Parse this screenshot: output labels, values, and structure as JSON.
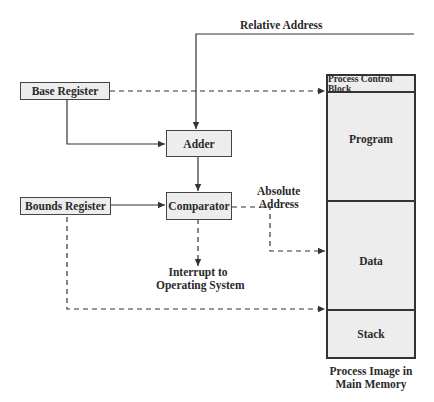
{
  "diagram": {
    "inputs": {
      "relative_address": "Relative Address"
    },
    "registers": {
      "base": "Base Register",
      "bounds": "Bounds Register"
    },
    "units": {
      "adder": "Adder",
      "comparator": "Comparator"
    },
    "labels": {
      "absolute_address_line1": "Absolute",
      "absolute_address_line2": "Address",
      "interrupt_line1": "Interrupt to",
      "interrupt_line2": "Operating System"
    },
    "memory": {
      "segments": [
        "Process Control Block",
        "Program",
        "Data",
        "Stack"
      ],
      "caption_line1": "Process Image in",
      "caption_line2": "Main Memory"
    },
    "colors": {
      "box_fill": "#ededed",
      "line": "#333333",
      "background": "#ffffff"
    }
  }
}
